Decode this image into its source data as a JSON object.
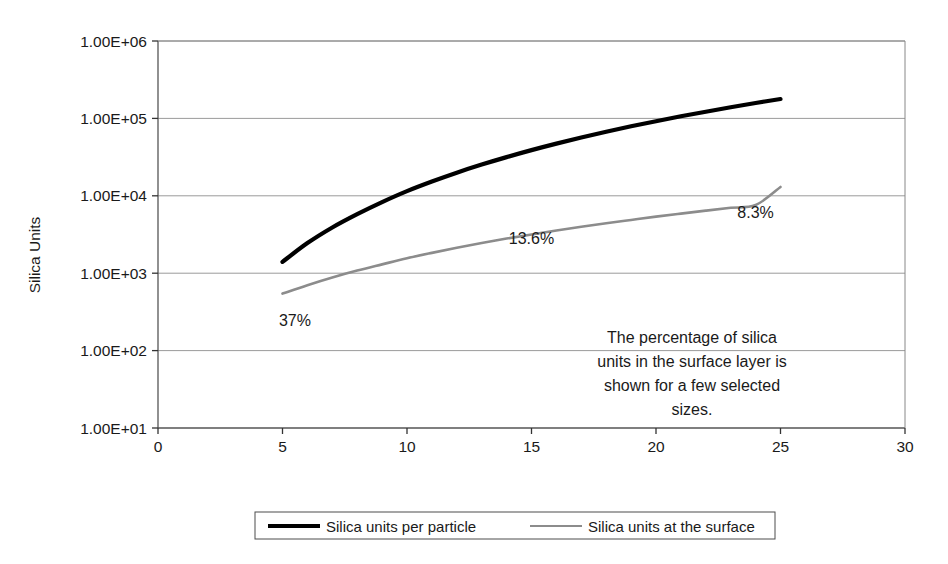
{
  "chart_data": {
    "type": "line",
    "title": "",
    "xlabel": "",
    "ylabel": "Silica Units",
    "yscale": "log",
    "xlim": [
      0,
      30
    ],
    "ylim": [
      10,
      1000000
    ],
    "grid": true,
    "xticks": [
      "0",
      "5",
      "10",
      "15",
      "20",
      "25",
      "30"
    ],
    "xtick_values": [
      0,
      5,
      10,
      15,
      20,
      25,
      30
    ],
    "yticks": [
      "1.00E+01",
      "1.00E+02",
      "1.00E+03",
      "1.00E+04",
      "1.00E+05",
      "1.00E+06"
    ],
    "ytick_values": [
      10,
      100,
      1000,
      10000,
      100000,
      1000000
    ],
    "legend_position": "bottom",
    "x": [
      5,
      6,
      7,
      8,
      9,
      10,
      11,
      12,
      13,
      14,
      15,
      16,
      17,
      18,
      19,
      20,
      21,
      22,
      23,
      24,
      25
    ],
    "series": [
      {
        "name": "Silica units per particle",
        "color": "#000000",
        "width": 4.2,
        "values": [
          1400,
          2450,
          3900,
          5800,
          8300,
          11500,
          15300,
          19900,
          25300,
          31600,
          38900,
          47200,
          56600,
          67200,
          79000,
          92000,
          106400,
          122100,
          139300,
          158000,
          178000
        ]
      },
      {
        "name": "Silica units at the surface",
        "color": "#8c8c8c",
        "width": 2.6,
        "values": [
          545,
          700,
          880,
          1080,
          1300,
          1560,
          1830,
          2130,
          2450,
          2800,
          3170,
          3560,
          3980,
          4420,
          4880,
          5380,
          5890,
          6430,
          7000,
          7590,
          13000
        ]
      }
    ],
    "annotations": [
      {
        "text": "37%",
        "x": 5.5,
        "y": 210,
        "name": "percent-label-37"
      },
      {
        "text": "13.6%",
        "x": 15.0,
        "y": 2400,
        "name": "percent-label-13-6"
      },
      {
        "text": "8.3%",
        "x": 24.0,
        "y": 5200,
        "name": "percent-label-8-3"
      }
    ],
    "note_lines": [
      "The percentage of silica",
      "units in the surface layer is",
      "shown for a few selected",
      "sizes."
    ]
  },
  "legend": {
    "items": [
      {
        "label": "Silica units per particle",
        "color": "#000000",
        "thickness": "4.2"
      },
      {
        "label": "Silica units at the surface",
        "color": "#8c8c8c",
        "thickness": "2.2"
      }
    ]
  }
}
